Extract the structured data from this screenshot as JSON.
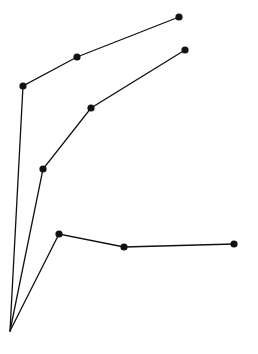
{
  "diagram": {
    "width": 258,
    "height": 354,
    "background": "#ffffff",
    "stroke_color": "#111111",
    "node_radius": 3.6,
    "origin": {
      "x": 10,
      "y": 331
    },
    "branches": [
      {
        "name": "upper-branch",
        "nodes": [
          {
            "x": 23,
            "y": 86
          },
          {
            "x": 77,
            "y": 57
          },
          {
            "x": 179,
            "y": 17
          }
        ]
      },
      {
        "name": "middle-branch",
        "nodes": [
          {
            "x": 43,
            "y": 169
          },
          {
            "x": 91,
            "y": 108
          },
          {
            "x": 185,
            "y": 50
          }
        ]
      },
      {
        "name": "lower-branch",
        "nodes": [
          {
            "x": 59,
            "y": 234
          },
          {
            "x": 124,
            "y": 247
          },
          {
            "x": 234,
            "y": 244
          }
        ]
      }
    ]
  }
}
